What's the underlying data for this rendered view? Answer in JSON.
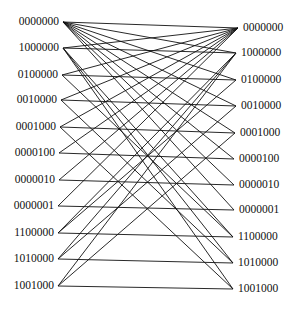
{
  "diagram": {
    "type": "bipartite-graph",
    "left_nodes": [
      {
        "id": "0000000",
        "label": "0000000",
        "x": 63,
        "y": 22
      },
      {
        "id": "1000000",
        "label": "1000000",
        "x": 63,
        "y": 48
      },
      {
        "id": "0100000",
        "label": "0100000",
        "x": 62,
        "y": 75
      },
      {
        "id": "0010000",
        "label": "0010000",
        "x": 61,
        "y": 100
      },
      {
        "id": "0001000",
        "label": "0001000",
        "x": 60,
        "y": 127
      },
      {
        "id": "0000100",
        "label": "0000100",
        "x": 59,
        "y": 153
      },
      {
        "id": "0000010",
        "label": "0000010",
        "x": 59,
        "y": 180
      },
      {
        "id": "0000001",
        "label": "0000001",
        "x": 58,
        "y": 206
      },
      {
        "id": "1100000",
        "label": "1100000",
        "x": 58,
        "y": 233
      },
      {
        "id": "1010000",
        "label": "1010000",
        "x": 58,
        "y": 259
      },
      {
        "id": "1001000",
        "label": "1001000",
        "x": 58,
        "y": 286
      }
    ],
    "right_nodes": [
      {
        "id": "0000000",
        "label": "0000000",
        "x": 238,
        "y": 28
      },
      {
        "id": "1000000",
        "label": "1000000",
        "x": 236,
        "y": 53
      },
      {
        "id": "0100000",
        "label": "0100000",
        "x": 236,
        "y": 80
      },
      {
        "id": "0010000",
        "label": "0010000",
        "x": 236,
        "y": 106
      },
      {
        "id": "0001000",
        "label": "0001000",
        "x": 235,
        "y": 133
      },
      {
        "id": "0000100",
        "label": "0000100",
        "x": 234,
        "y": 159
      },
      {
        "id": "0000010",
        "label": "0000010",
        "x": 234,
        "y": 185
      },
      {
        "id": "0000001",
        "label": "0000001",
        "x": 234,
        "y": 210
      },
      {
        "id": "1100000",
        "label": "1100000",
        "x": 233,
        "y": 237
      },
      {
        "id": "1010000",
        "label": "1010000",
        "x": 233,
        "y": 263
      },
      {
        "id": "1001000",
        "label": "1001000",
        "x": 233,
        "y": 289
      }
    ],
    "edges": [
      [
        "0000000",
        "0000000"
      ],
      [
        "0000000",
        "1000000"
      ],
      [
        "0000000",
        "0100000"
      ],
      [
        "0000000",
        "0010000"
      ],
      [
        "0000000",
        "0001000"
      ],
      [
        "0000000",
        "0000100"
      ],
      [
        "0000000",
        "0000010"
      ],
      [
        "0000000",
        "0000001"
      ],
      [
        "1000000",
        "1000000"
      ],
      [
        "1000000",
        "0000000"
      ],
      [
        "1000000",
        "1100000"
      ],
      [
        "1000000",
        "1010000"
      ],
      [
        "1000000",
        "1001000"
      ],
      [
        "0100000",
        "0100000"
      ],
      [
        "0100000",
        "0000000"
      ],
      [
        "0100000",
        "1100000"
      ],
      [
        "0010000",
        "0010000"
      ],
      [
        "0010000",
        "0000000"
      ],
      [
        "0010000",
        "1010000"
      ],
      [
        "0001000",
        "0001000"
      ],
      [
        "0001000",
        "0000000"
      ],
      [
        "0001000",
        "1001000"
      ],
      [
        "0000100",
        "0000100"
      ],
      [
        "0000100",
        "0000000"
      ],
      [
        "0000010",
        "0000010"
      ],
      [
        "0000010",
        "0000000"
      ],
      [
        "0000001",
        "0000001"
      ],
      [
        "0000001",
        "0000000"
      ],
      [
        "1100000",
        "1100000"
      ],
      [
        "1100000",
        "1000000"
      ],
      [
        "1100000",
        "0100000"
      ],
      [
        "1010000",
        "1010000"
      ],
      [
        "1010000",
        "1000000"
      ],
      [
        "1010000",
        "0010000"
      ],
      [
        "1001000",
        "1001000"
      ],
      [
        "1001000",
        "1000000"
      ],
      [
        "1001000",
        "0001000"
      ]
    ]
  }
}
